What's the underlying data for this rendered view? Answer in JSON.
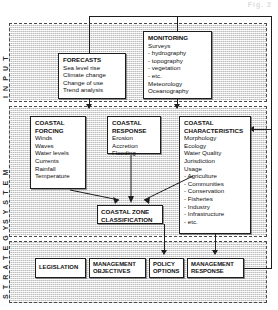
{
  "page": {
    "artifact_text": "Fig. 2"
  },
  "diagram": {
    "bands": [
      {
        "id": "input",
        "label": "I N P U T"
      },
      {
        "id": "system",
        "label": "S Y S T E M"
      },
      {
        "id": "strategy",
        "label": "S T R A T E G Y"
      }
    ],
    "boxes": {
      "forecasts": {
        "header": "FORECASTS",
        "items": [
          "Sea level rise",
          "Climate change",
          "Change of use",
          "Trend analysis"
        ]
      },
      "monitoring": {
        "header": "MONITORING",
        "items": [
          "Surveys",
          "-  hydrography",
          "-  topography",
          "-  vegetation",
          "-  etc.",
          "Meteorology",
          "Oceanography"
        ]
      },
      "coastal_forcing": {
        "header_line1": "COASTAL",
        "header_line2": "FORCING",
        "items": [
          "Winds",
          "Waves",
          "Water levels",
          "Currents",
          "Rainfall",
          "Temperature"
        ]
      },
      "coastal_response": {
        "header_line1": "COASTAL",
        "header_line2": "RESPONSE",
        "items": [
          "Erosion",
          "Accretion",
          "Flooding"
        ]
      },
      "coastal_characteristics": {
        "header_line1": "COASTAL",
        "header_line2": "CHARACTERISTICS",
        "items": [
          "Morphology",
          "Ecology",
          "Water Quality",
          "Jurisdiction",
          "Usage",
          "-  Agriculture",
          "-  Communities",
          "-  Conservation",
          "-  Fisheries",
          "-  Industry",
          "-  Infrastructure",
          "-  etc."
        ]
      },
      "coastal_zone_classification": {
        "line1": "COASTAL ZONE",
        "line2": "CLASSIFICATION"
      },
      "legislation": {
        "line1": "LEGISLATION"
      },
      "management_objectives": {
        "line1": "MANAGEMENT",
        "line2": "OBJECTIVES"
      },
      "policy_options": {
        "line1": "POLICY",
        "line2": "OPTIONS"
      },
      "management_response": {
        "line1": "MANAGEMENT",
        "line2": "RESPONSE"
      }
    },
    "colors": {
      "band_fill": "#e4e4e4",
      "stroke": "#1d1d1d",
      "box_fill": "#ffffff",
      "band_border": "#4a4a4a"
    }
  }
}
